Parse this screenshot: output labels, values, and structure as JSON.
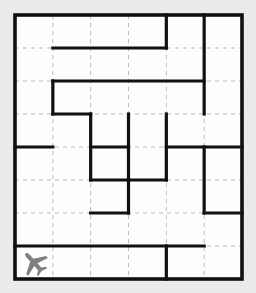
{
  "puzzle": {
    "title": "Airplane Maze Grid",
    "type": "grid-maze",
    "columns": 6,
    "rows": 8,
    "cell_size": 37.83,
    "origin_x": 15,
    "origin_y": 15,
    "board_width": 227,
    "board_height": 264
  },
  "colors": {
    "background": "#ebebeb",
    "cell_fill": "#fdfdfd",
    "wall": "#111111",
    "gridline": "#b9b9b9",
    "token": "#808080"
  },
  "tokens": [
    {
      "name": "airplane",
      "icon": "airplane-icon",
      "col": 0,
      "row": 7,
      "heading": "northeast",
      "color": "#808080"
    }
  ],
  "grid_lines": {
    "style": "dashed",
    "vertical_x": [
      52.83,
      90.67,
      128.5,
      166.33,
      204.17
    ],
    "horizontal_y": [
      48,
      81,
      114,
      147,
      180,
      213,
      246
    ]
  },
  "outer_border": {
    "x": 15,
    "y": 15,
    "width": 227,
    "height": 264
  },
  "walls": {
    "horizontal": [
      {
        "row": 1,
        "col_start": 1,
        "col_end": 4
      },
      {
        "row": 2,
        "col_start": 1,
        "col_end": 5
      },
      {
        "row": 3,
        "col_start": 1,
        "col_end": 2
      },
      {
        "row": 4,
        "col_start": 0,
        "col_end": 1
      },
      {
        "row": 4,
        "col_start": 2,
        "col_end": 3
      },
      {
        "row": 4,
        "col_start": 4,
        "col_end": 6
      },
      {
        "row": 5,
        "col_start": 2,
        "col_end": 4
      },
      {
        "row": 6,
        "col_start": 2,
        "col_end": 3
      },
      {
        "row": 6,
        "col_start": 5,
        "col_end": 6
      },
      {
        "row": 7,
        "col_start": 0,
        "col_end": 5
      }
    ],
    "vertical": [
      {
        "col": 4,
        "row_start": 0,
        "row_end": 1
      },
      {
        "col": 5,
        "row_start": 0,
        "row_end": 3
      },
      {
        "col": 1,
        "row_start": 2,
        "row_end": 3
      },
      {
        "col": 2,
        "row_start": 3,
        "row_end": 5
      },
      {
        "col": 3,
        "row_start": 3,
        "row_end": 5
      },
      {
        "col": 4,
        "row_start": 3,
        "row_end": 5
      },
      {
        "col": 5,
        "row_start": 4,
        "row_end": 6
      },
      {
        "col": 3,
        "row_start": 5,
        "row_end": 6
      },
      {
        "col": 4,
        "row_start": 7,
        "row_end": 8
      }
    ]
  }
}
